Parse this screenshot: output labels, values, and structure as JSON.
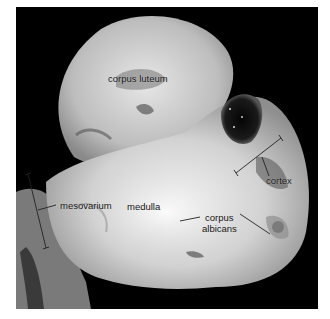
{
  "figure": {
    "background_color": "#000000",
    "tissue_color": "#cfcfcf",
    "labels": [
      {
        "id": "corpus-luteum",
        "text": "corpus luteum"
      },
      {
        "id": "cortex",
        "text": "cortex"
      },
      {
        "id": "mesovarium",
        "text": "mesovarium"
      },
      {
        "id": "medulla",
        "text": "medulla"
      },
      {
        "id": "corpus-albicans-line1",
        "text": "corpus"
      },
      {
        "id": "corpus-albicans-line2",
        "text": "albicans"
      }
    ]
  }
}
